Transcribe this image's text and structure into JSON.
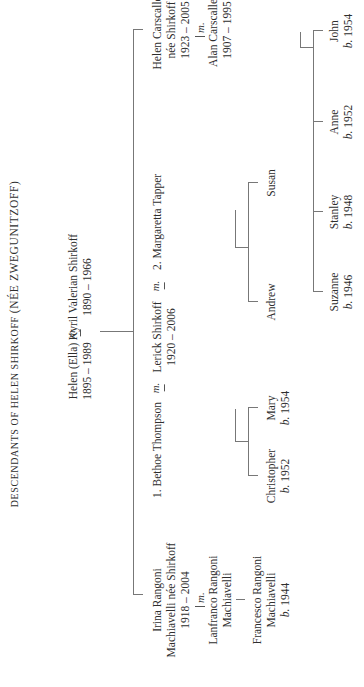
{
  "title": {
    "prefix": "DESCENDANTS OF HELEN SHIRKOFF",
    "suffix": "(NÉE ZWEGUNITZOFF)"
  },
  "marriage_symbol": "m.",
  "birth_prefix": "b.",
  "generation1": {
    "wife": {
      "name": "Helen (Ella)",
      "dates": "1895 – 1989"
    },
    "husband": {
      "name": "Kyril Valerian Shirkoff",
      "dates": "1890 – 1966"
    }
  },
  "generation2": {
    "irina": {
      "name_line1": "Irina Rangoni",
      "name_line2": "Machiavelli née Shirkoff",
      "dates": "1918 – 2004",
      "spouse_line1": "Lanfranco Rangoni",
      "spouse_line2": "Machiavelli",
      "child_line1": "Francesco Rangoni",
      "child_line2": "Machiavelli",
      "child_birth": "1944"
    },
    "lerick": {
      "name": "Lerick Shirkoff",
      "dates": "1920 – 2006",
      "wife1": "1. Bethoe Thompson",
      "wife2": "2. Margaretta Tapper"
    },
    "helen": {
      "name_line1": "Helen Carscallen",
      "name_line2": "née Shirkoff",
      "dates": "1923 – 2005",
      "spouse_name": "Alan Carscallen",
      "spouse_dates": "1907 – 1995"
    }
  },
  "generation3": {
    "bethoe_children": [
      {
        "name": "Christopher",
        "birth": "1952"
      },
      {
        "name": "Mary",
        "birth": "1954"
      }
    ],
    "margaretta_children": [
      {
        "name": "Andrew"
      },
      {
        "name": "Susan"
      }
    ],
    "carscallen_children": [
      {
        "name": "Suzanne",
        "birth": "1946"
      },
      {
        "name": "Stanley",
        "birth": "1948"
      },
      {
        "name": "Anne",
        "birth": "1952"
      },
      {
        "name": "John",
        "birth": "1954"
      }
    ]
  }
}
